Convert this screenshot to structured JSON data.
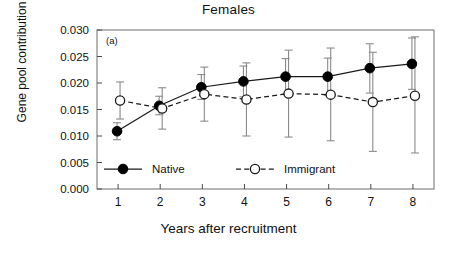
{
  "chart_data": {
    "type": "line",
    "title": "Females",
    "panel_label": "(a)",
    "xlabel": "Years after recruitment",
    "ylabel": "Gene pool contribution",
    "grid": false,
    "legend_position": "inside-bottom-left",
    "x": [
      1,
      2,
      3,
      4,
      5,
      6,
      7,
      8
    ],
    "xtick_labels": [
      "1",
      "2",
      "3",
      "4",
      "5",
      "6",
      "7",
      "8"
    ],
    "xlim": [
      0.5,
      8.5
    ],
    "ylim": [
      0.0,
      0.03
    ],
    "ytick_labels": [
      "0.000",
      "0.005",
      "0.010",
      "0.015",
      "0.020",
      "0.025",
      "0.030"
    ],
    "ytick_values": [
      0.0,
      0.005,
      0.01,
      0.015,
      0.02,
      0.025,
      0.03
    ],
    "series": [
      {
        "name": "Native",
        "marker": "filled-circle",
        "linestyle": "solid",
        "color": "#000000",
        "values": [
          0.0109,
          0.0157,
          0.0192,
          0.0203,
          0.0212,
          0.0212,
          0.0228,
          0.0236
        ],
        "err_low": [
          0.0093,
          0.014,
          0.0169,
          0.0174,
          0.0179,
          0.0177,
          0.0181,
          0.0188
        ],
        "err_high": [
          0.0125,
          0.0175,
          0.0216,
          0.0232,
          0.0246,
          0.0247,
          0.0274,
          0.0285
        ]
      },
      {
        "name": "Immigrant",
        "marker": "open-circle",
        "linestyle": "dashed",
        "color": "#ffffff",
        "values": [
          0.0167,
          0.0152,
          0.0179,
          0.0169,
          0.018,
          0.0178,
          0.0164,
          0.0176
        ],
        "err_low": [
          0.0132,
          0.0113,
          0.0128,
          0.01,
          0.0098,
          0.0091,
          0.0071,
          0.0068
        ],
        "err_high": [
          0.0202,
          0.0191,
          0.023,
          0.0238,
          0.0262,
          0.0266,
          0.0258,
          0.0287
        ]
      }
    ],
    "legend": [
      {
        "label": "Native",
        "marker": "filled-circle",
        "linestyle": "solid"
      },
      {
        "label": "Immigrant",
        "marker": "open-circle",
        "linestyle": "dashed"
      }
    ]
  }
}
